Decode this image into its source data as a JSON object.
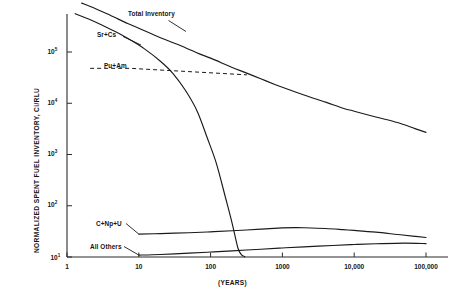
{
  "chart_data": {
    "type": "line",
    "title": "",
    "xlabel": "(YEARS)",
    "ylabel": "NORMALIZED SPENT FUEL INVENTORY, Ci/RLU",
    "xscale": "log",
    "yscale": "log",
    "xlim": [
      1,
      100000
    ],
    "ylim": [
      10,
      1000000
    ],
    "grid": false,
    "legend_position": "inline-curve-labels",
    "x_tick_labels": [
      "1",
      "10",
      "100",
      "1000",
      "10,000",
      "100,000"
    ],
    "x_tick_values": [
      1,
      10,
      100,
      1000,
      10000,
      100000
    ],
    "y_tick_labels": [
      "10¹",
      "10²",
      "10³",
      "10⁴",
      "10⁵"
    ],
    "y_tick_values": [
      10,
      100,
      1000,
      10000,
      100000
    ],
    "y_tick_bases": [
      "10",
      "10",
      "10",
      "10",
      "10"
    ],
    "y_tick_exponents": [
      "1",
      "2",
      "3",
      "4",
      "5"
    ],
    "series": [
      {
        "name": "Total Inventory",
        "style": "solid",
        "label_x": 1.9,
        "x": [
          1.6,
          2.5,
          4,
          7,
          10,
          20,
          40,
          70,
          100,
          200,
          300,
          500,
          800,
          1000,
          2000,
          4000,
          7000,
          10000,
          20000,
          40000,
          70000,
          100000
        ],
        "y": [
          900000,
          700000,
          520000,
          360000,
          290000,
          190000,
          130000,
          92000,
          76000,
          50000,
          40000,
          30000,
          23000,
          20500,
          14500,
          10500,
          8000,
          7000,
          5400,
          4200,
          3200,
          2700
        ]
      },
      {
        "name": "Sr+Cs",
        "style": "solid",
        "label_x": 1.35,
        "x": [
          1.3,
          2,
          3,
          5,
          8,
          12,
          20,
          30,
          45,
          65,
          90,
          120,
          160,
          200,
          240,
          270,
          290,
          300
        ],
        "y": [
          560000,
          440000,
          340000,
          240000,
          165000,
          115000,
          66000,
          38000,
          17500,
          7000,
          2100,
          680,
          150,
          45,
          15,
          11,
          10.4,
          10
        ]
      },
      {
        "name": "Pu+Am",
        "style": "dashed",
        "label_x": 1.55,
        "leader_from_x": 2.1,
        "leader_to_x": 320,
        "leader_y": 48000
      },
      {
        "name": "C+Np+U",
        "style": "solid",
        "label_x": 7.0,
        "x": [
          10,
          20,
          50,
          100,
          200,
          500,
          1000,
          1500,
          2000,
          4000,
          7000,
          10000,
          20000,
          40000,
          70000,
          100000
        ],
        "y": [
          28,
          28.6,
          29.8,
          31,
          32.5,
          35,
          37,
          37.5,
          37.3,
          36,
          34.2,
          33,
          30.5,
          27.5,
          25.3,
          24
        ]
      },
      {
        "name": "All Others",
        "style": "solid",
        "label_x": 3.4,
        "x": [
          10,
          20,
          50,
          100,
          200,
          500,
          1000,
          2000,
          5000,
          10000,
          20000,
          50000,
          100000
        ],
        "y": [
          10.9,
          11.2,
          11.9,
          12.5,
          13.2,
          14.2,
          15.0,
          15.8,
          16.8,
          17.5,
          18.1,
          18.7,
          18.2
        ]
      }
    ],
    "colors": {
      "axis": "#2b2b2b",
      "curve": "#1a1a1a",
      "text": "#141414",
      "background": "#ffffff"
    }
  }
}
